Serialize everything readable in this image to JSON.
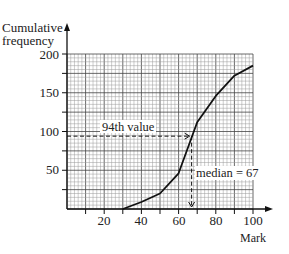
{
  "chart_data": {
    "type": "line",
    "title": "",
    "xlabel": "Mark",
    "ylabel": "Cumulative frequency",
    "ylabel_lines": [
      "Cumulative",
      "frequency"
    ],
    "xlim": [
      0,
      100
    ],
    "ylim": [
      0,
      200
    ],
    "x_ticks": [
      20,
      40,
      60,
      80,
      100
    ],
    "x_tick_labels": [
      "20",
      "40",
      "60",
      "80",
      "100"
    ],
    "x_minor_ticks": [
      10,
      30,
      50,
      70,
      90
    ],
    "y_ticks": [
      50,
      100,
      150,
      200
    ],
    "y_tick_labels": [
      "50",
      "100",
      "150",
      "200"
    ],
    "y_minor_ticks": [
      25,
      75,
      125,
      175
    ],
    "grid": true,
    "grid_minor_step": {
      "x": 2,
      "y": 5
    },
    "grid_major_step": {
      "x": 10,
      "y": 25
    },
    "series": [
      {
        "name": "Cumulative frequency",
        "x": [
          30,
          40,
          50,
          60,
          70,
          80,
          90,
          100
        ],
        "values": [
          0,
          9,
          20,
          46,
          112,
          146,
          172,
          185
        ]
      }
    ],
    "annotations": [
      {
        "text": "94th value",
        "type": "horizontal-dashed",
        "y": 94,
        "x_from": 0,
        "x_to": 67
      },
      {
        "text": "median = 67",
        "type": "vertical-dashed",
        "x": 67,
        "y_from": 94,
        "y_to": 0
      }
    ]
  },
  "labels": {
    "ylabel_line1": "Cumulative",
    "ylabel_line2": "frequency",
    "xlabel": "Mark",
    "annotation_94th": "94th value",
    "annotation_median": "median = 67",
    "yticks": [
      "50",
      "100",
      "150",
      "200"
    ],
    "xticks": [
      "20",
      "40",
      "60",
      "80",
      "100"
    ]
  },
  "colors": {
    "axis": "#111111",
    "grid_minor": "#9a9a9a",
    "grid_major": "#444444",
    "curve": "#111111",
    "text": "#222222"
  }
}
